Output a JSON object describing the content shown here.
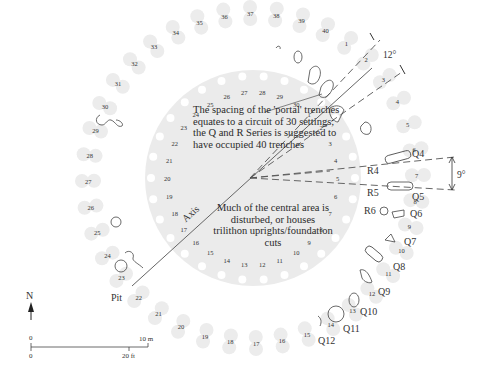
{
  "diagram": {
    "center": [
      253,
      178
    ],
    "disc_radius": 108,
    "disc_color": "#ebebeb",
    "setting_color": "#ececec",
    "line_color": "#555555",
    "inner_ring": {
      "count": 30,
      "radius": 98,
      "labels": [
        "1",
        "2",
        "3",
        "4",
        "5",
        "6",
        "7",
        "8",
        "9",
        "10",
        "11",
        "12",
        "13",
        "14",
        "15",
        "16",
        "17",
        "18",
        "19",
        "20",
        "21",
        "22",
        "23",
        "24",
        "25",
        "26",
        "27",
        "28",
        "29",
        "30"
      ]
    },
    "outer_ring": {
      "count": 40,
      "radius": 165,
      "labels": [
        "1",
        "2",
        "3",
        "4",
        "5",
        "6",
        "7",
        "8",
        "9",
        "10",
        "11",
        "12",
        "13",
        "14",
        "15",
        "16",
        "17",
        "18",
        "19",
        "20",
        "21",
        "22",
        "23",
        "24",
        "25",
        "26",
        "27",
        "28",
        "29",
        "30",
        "31",
        "32",
        "33",
        "34",
        "35",
        "36",
        "37",
        "38",
        "39",
        "40"
      ]
    },
    "notes": {
      "portal": "The spacing of the 'portal' trenches equates to a circuit of 30 settings; the Q and R Series is suggested to have occupied 40 trenches",
      "central": "Much of the central area is disturbed, or houses trilithon uprights/foundation cuts"
    },
    "labels": {
      "axis": "Axis",
      "pit": "Pit",
      "angle_top": "12°",
      "angle_right": "9°",
      "q_series": [
        "Q4",
        "Q5",
        "Q6",
        "Q7",
        "Q8",
        "Q9",
        "Q10",
        "Q11",
        "Q12"
      ],
      "r_series": [
        "R4",
        "R5",
        "R6"
      ]
    },
    "north": "N",
    "scale": {
      "zero_top": "0",
      "metric": "10 m",
      "zero_bottom": "0",
      "imperial": "20 ft"
    }
  }
}
